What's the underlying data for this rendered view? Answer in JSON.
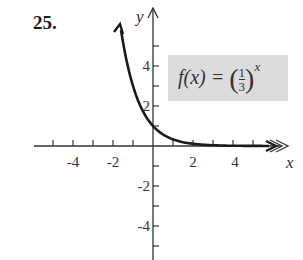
{
  "problem_number": "25.",
  "formula": {
    "lhs": "f(x) = ",
    "numerator": "1",
    "denominator": "3",
    "exponent": "x",
    "full": "f(x) = (1/3)^x"
  },
  "chart_data": {
    "type": "line",
    "title": "",
    "xlabel": "x",
    "ylabel": "y",
    "xlim": [
      -5.5,
      6
    ],
    "ylim": [
      -5.5,
      6.3
    ],
    "x_tick_labels": [
      "-4",
      "-2",
      "2",
      "4"
    ],
    "y_tick_labels": [
      "4",
      "2",
      "-2",
      "-4"
    ],
    "grid": false,
    "legend": null,
    "series": [
      {
        "name": "f(x) = (1/3)^x",
        "x": [
          -1.65,
          -1.5,
          -1,
          -0.5,
          0,
          0.5,
          1,
          1.5,
          2,
          3,
          4,
          5,
          5.8
        ],
        "values": [
          6.13,
          5.2,
          3,
          1.73,
          1,
          0.58,
          0.33,
          0.19,
          0.11,
          0.04,
          0.01,
          0.004,
          0.002
        ]
      }
    ],
    "annotation": "f(x) = (1/3)^x"
  }
}
